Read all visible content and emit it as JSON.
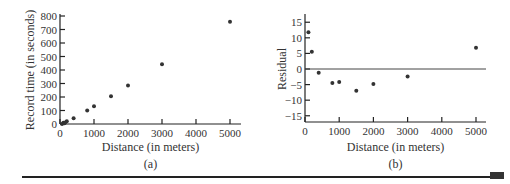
{
  "chart_data": [
    {
      "type": "scatter",
      "panel_label": "(a)",
      "xlabel": "Distance (in meters)",
      "ylabel": "Record time (in seconds)",
      "xlim": [
        0,
        5300
      ],
      "ylim": [
        0,
        800
      ],
      "xticks": [
        0,
        1000,
        2000,
        3000,
        4000,
        5000
      ],
      "yticks": [
        0,
        100,
        200,
        300,
        400,
        500,
        600,
        700,
        800
      ],
      "grid": false,
      "points": [
        {
          "x": 100,
          "y": 10
        },
        {
          "x": 200,
          "y": 20
        },
        {
          "x": 400,
          "y": 43
        },
        {
          "x": 800,
          "y": 100
        },
        {
          "x": 1000,
          "y": 132
        },
        {
          "x": 1500,
          "y": 206
        },
        {
          "x": 2000,
          "y": 285
        },
        {
          "x": 3000,
          "y": 442
        },
        {
          "x": 5000,
          "y": 758
        }
      ]
    },
    {
      "type": "scatter",
      "panel_label": "(b)",
      "xlabel": "Distance (in meters)",
      "ylabel": "Residual",
      "xlim": [
        0,
        5300
      ],
      "ylim": [
        -17,
        17
      ],
      "xticks": [
        0,
        1000,
        2000,
        3000,
        4000,
        5000
      ],
      "yticks": [
        15,
        10,
        5,
        0,
        -5,
        -10,
        -15
      ],
      "reference_line": 0,
      "grid": false,
      "points": [
        {
          "x": 100,
          "y": 11.8
        },
        {
          "x": 200,
          "y": 5.5
        },
        {
          "x": 400,
          "y": -1.2
        },
        {
          "x": 800,
          "y": -4.5
        },
        {
          "x": 1000,
          "y": -4.2
        },
        {
          "x": 1500,
          "y": -7.0
        },
        {
          "x": 2000,
          "y": -4.8
        },
        {
          "x": 3000,
          "y": -2.4
        },
        {
          "x": 5000,
          "y": 6.8
        }
      ]
    }
  ]
}
